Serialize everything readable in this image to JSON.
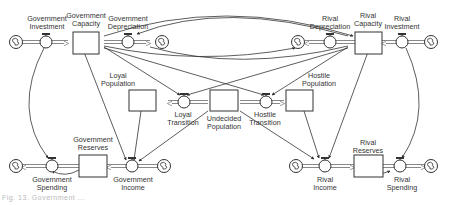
{
  "diagram": {
    "type": "stock-and-flow",
    "stocks": [
      {
        "id": "gov_capacity",
        "label_line1": "Government",
        "label_line2": "Capacity"
      },
      {
        "id": "rival_capacity",
        "label_line1": "Rival",
        "label_line2": "Capacity"
      },
      {
        "id": "loyal_population",
        "label_line1": "Loyal",
        "label_line2": "Population"
      },
      {
        "id": "undecided_population",
        "label_line1": "Undecided",
        "label_line2": "Population"
      },
      {
        "id": "hostile_population",
        "label_line1": "Hostile",
        "label_line2": "Population"
      },
      {
        "id": "gov_reserves",
        "label_line1": "Government",
        "label_line2": "Reserves"
      },
      {
        "id": "rival_reserves",
        "label_line1": "Rival",
        "label_line2": "Reserves"
      }
    ],
    "flows": [
      {
        "id": "gov_investment",
        "label_line1": "Government",
        "label_line2": "Investment"
      },
      {
        "id": "gov_depreciation",
        "label_line1": "Government",
        "label_line2": "Depreciation"
      },
      {
        "id": "rival_depreciation",
        "label_line1": "Rival",
        "label_line2": "Depreciation"
      },
      {
        "id": "rival_investment",
        "label_line1": "Rival",
        "label_line2": "Investment"
      },
      {
        "id": "loyal_transition",
        "label_line1": "Loyal",
        "label_line2": "Transition"
      },
      {
        "id": "hostile_transition",
        "label_line1": "Hostile",
        "label_line2": "Transition"
      },
      {
        "id": "gov_spending",
        "label_line1": "Government",
        "label_line2": "Spending"
      },
      {
        "id": "gov_income",
        "label_line1": "Government",
        "label_line2": "Income"
      },
      {
        "id": "rival_income",
        "label_line1": "Rival",
        "label_line2": "Income"
      },
      {
        "id": "rival_spending",
        "label_line1": "Rival",
        "label_line2": "Spending"
      }
    ],
    "caption": "Fig. 13. Government ..."
  },
  "colors": {
    "line": "#333333",
    "pipe": "#888888",
    "background": "#ffffff"
  }
}
